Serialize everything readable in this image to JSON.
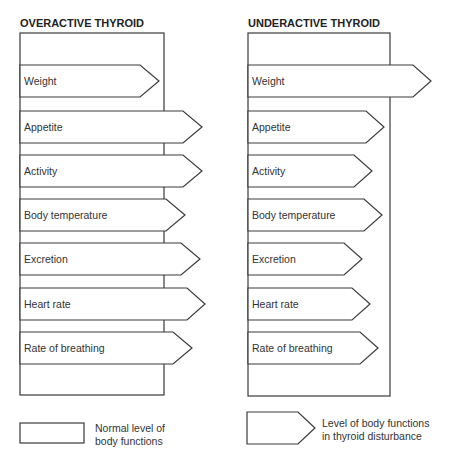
{
  "panels": [
    {
      "id": "overactive",
      "title": "OVERACTIVE THYROID",
      "box": {
        "x": 20,
        "y": 33,
        "w": 144,
        "h": 362
      },
      "arrows": [
        {
          "label": "Weight",
          "y": 65,
          "body_end": 140,
          "tip": 159
        },
        {
          "label": "Appetite",
          "y": 111,
          "body_end": 183,
          "tip": 202
        },
        {
          "label": "Activity",
          "y": 155,
          "body_end": 183,
          "tip": 202
        },
        {
          "label": "Body temperature",
          "y": 199,
          "body_end": 166,
          "tip": 185
        },
        {
          "label": "Excretion",
          "y": 243,
          "body_end": 181,
          "tip": 200
        },
        {
          "label": "Heart rate",
          "y": 288,
          "body_end": 187,
          "tip": 205
        },
        {
          "label": "Rate of breathing",
          "y": 332,
          "body_end": 173,
          "tip": 192
        }
      ]
    },
    {
      "id": "underactive",
      "title": "UNDERACTIVE THYROID",
      "box": {
        "x": 248,
        "y": 33,
        "w": 142,
        "h": 363
      },
      "arrows": [
        {
          "label": "Weight",
          "y": 65,
          "body_end": 413,
          "tip": 431
        },
        {
          "label": "Appetite",
          "y": 111,
          "body_end": 366,
          "tip": 384
        },
        {
          "label": "Activity",
          "y": 155,
          "body_end": 354,
          "tip": 372
        },
        {
          "label": "Body temperature",
          "y": 199,
          "body_end": 364,
          "tip": 382
        },
        {
          "label": "Excretion",
          "y": 243,
          "body_end": 344,
          "tip": 362
        },
        {
          "label": "Heart rate",
          "y": 288,
          "body_end": 352,
          "tip": 370
        },
        {
          "label": "Rate of breathing",
          "y": 332,
          "body_end": 360,
          "tip": 378
        }
      ]
    }
  ],
  "legend": {
    "normal": {
      "line1": "Normal level of",
      "line2": "body functions"
    },
    "disturbed": {
      "line1": "Level of body functions",
      "line2": "in thyroid disturbance"
    }
  },
  "colors": {
    "stroke": "#3a3a3a",
    "fill": "#ffffff",
    "text": "#333333"
  }
}
